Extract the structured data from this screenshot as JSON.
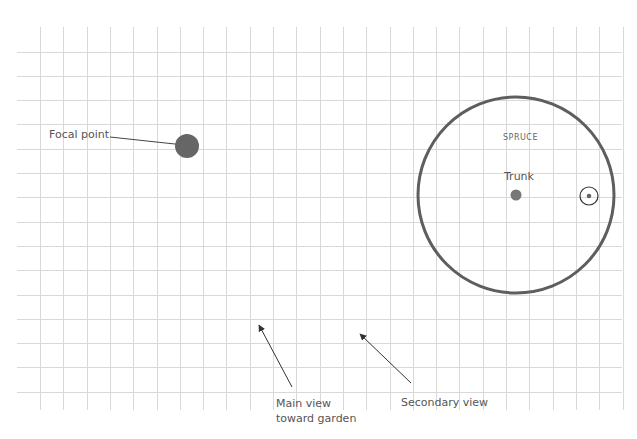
{
  "diagram": {
    "type": "garden-site-plan-grid",
    "grid": {
      "color": "#d9d9d9",
      "x_start": 40,
      "x_step": 23.3,
      "x_count": 26,
      "y_top": 27,
      "y_bottom": 410,
      "y_start": 51.5,
      "y_step": 24.3,
      "y_count": 15,
      "x_left": 17,
      "x_right": 622
    },
    "colors": {
      "stroke_dark": "#5e5e5e",
      "fill_dark": "#666666",
      "arrow": "#333333",
      "text": "#555555"
    },
    "labels": {
      "focal_point": "Focal point",
      "spruce": "SPRUCE",
      "trunk": "Trunk",
      "main_view": "Main view\ntoward garden",
      "secondary_view": "Secondary view"
    }
  }
}
